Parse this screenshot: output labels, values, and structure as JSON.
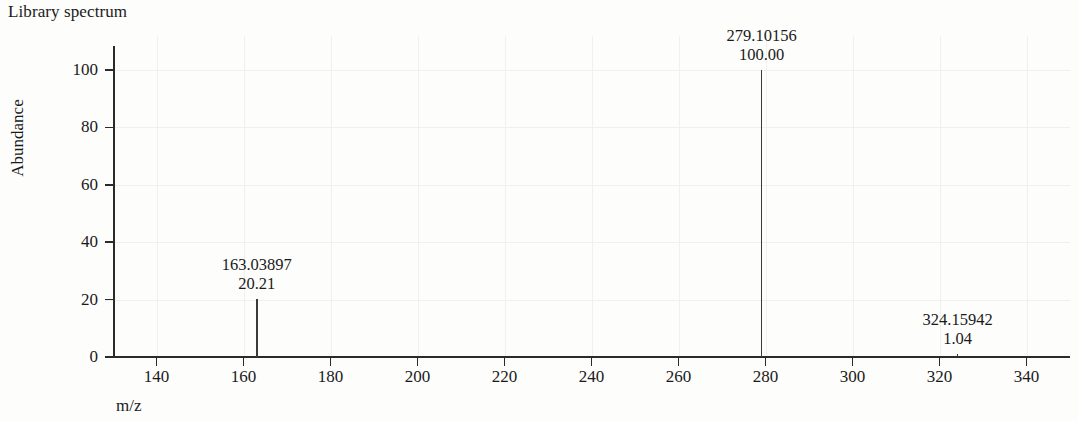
{
  "title": "Library spectrum",
  "axes": {
    "x_title": "m/z",
    "y_title": "Abundance"
  },
  "chart_data": {
    "type": "bar",
    "title": "Library spectrum",
    "xlabel": "m/z",
    "ylabel": "Abundance",
    "xlim": [
      130,
      350
    ],
    "ylim": [
      0,
      108
    ],
    "grid": true,
    "legend": "none",
    "x_ticks": [
      140,
      160,
      180,
      200,
      220,
      240,
      260,
      280,
      300,
      320,
      340
    ],
    "y_ticks": [
      0,
      20,
      40,
      60,
      80,
      100
    ],
    "x_tick_labels": [
      "140",
      "160",
      "180",
      "200",
      "220",
      "240",
      "260",
      "280",
      "300",
      "320",
      "340"
    ],
    "y_tick_labels": [
      "0",
      "20",
      "40",
      "60",
      "80",
      "100"
    ],
    "peaks": [
      {
        "mz": 163.03897,
        "abundance": 20.21,
        "mz_label": "163.03897",
        "abundance_label": "20.21"
      },
      {
        "mz": 279.10156,
        "abundance": 100.0,
        "mz_label": "279.10156",
        "abundance_label": "100.00"
      },
      {
        "mz": 324.15942,
        "abundance": 1.04,
        "mz_label": "324.15942",
        "abundance_label": "1.04"
      }
    ],
    "base_peak_mz": 279.10156
  }
}
